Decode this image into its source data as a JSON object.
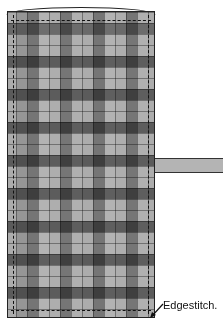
{
  "diagram": {
    "title": "",
    "fabric": {
      "pattern": "plaid",
      "column_width": 11,
      "row_height": 11,
      "column_shades": [
        "#bdbdbd",
        "#8c8c8c",
        "#3e3e3e",
        "#d0d0d0",
        "#c2c2c2",
        "#404040",
        "#c8c8c8",
        "#bdbdbd",
        "#3e3e3e",
        "#d0d0d0",
        "#c2c2c2",
        "#404040",
        "#c8c8c8",
        "#bdbdbd"
      ],
      "row_shades": [
        "#c8c8c8",
        "#7a7a7a",
        "#c8c8c8",
        "#c8c8c8",
        "#6a6a6a",
        "#c8c8c8",
        "#c8c8c8",
        "#6a6a6a",
        "#c8c8c8",
        "#c8c8c8",
        "#6a6a6a",
        "#c8c8c8",
        "#c8c8c8",
        "#6a6a6a",
        "#c8c8c8",
        "#c8c8c8",
        "#6a6a6a",
        "#c8c8c8",
        "#c8c8c8",
        "#6a6a6a",
        "#c8c8c8",
        "#c8c8c8",
        "#6a6a6a",
        "#c8c8c8",
        "#c8c8c8",
        "#6a6a6a",
        "#c8c8c8",
        "#c8c8c8"
      ]
    },
    "strap": {
      "color": "#b4b4b4"
    },
    "stitch_line": {
      "style": "dashed",
      "color": "#111111"
    },
    "annotation": {
      "label": "Edgestitch."
    }
  }
}
